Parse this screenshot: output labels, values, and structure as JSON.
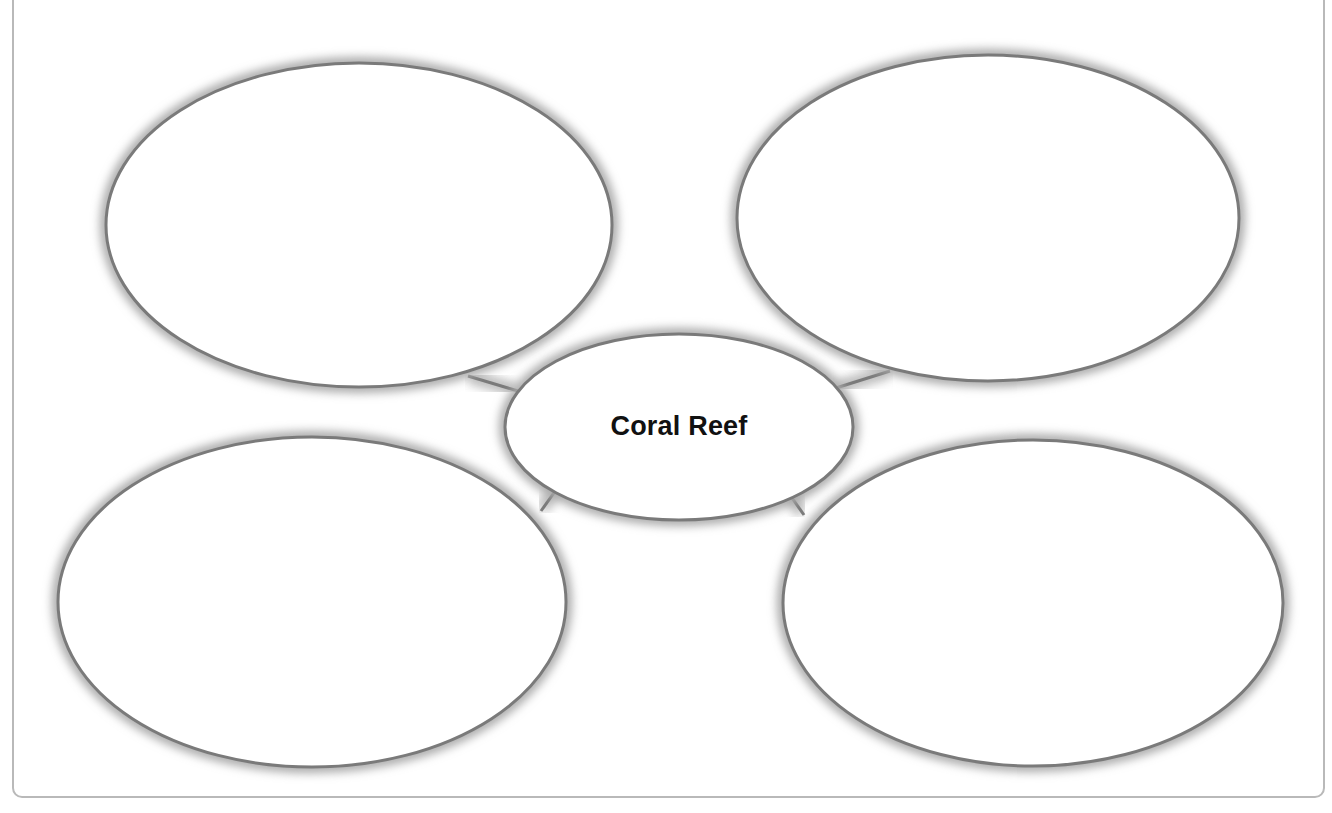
{
  "diagram": {
    "type": "concept-map",
    "center": {
      "label": "Coral Reef"
    },
    "bubbles": [
      {
        "position": "top-left",
        "label": ""
      },
      {
        "position": "top-right",
        "label": ""
      },
      {
        "position": "bottom-left",
        "label": ""
      },
      {
        "position": "bottom-right",
        "label": ""
      }
    ],
    "colors": {
      "stroke": "#7a7a7a",
      "shadow": "#9a9a9a",
      "fill": "#ffffff",
      "frame": "#b9b9b9",
      "text": "#111111"
    }
  }
}
